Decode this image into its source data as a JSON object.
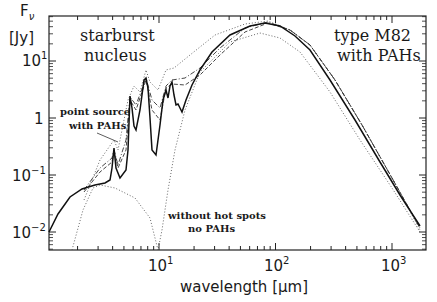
{
  "chart_data": {
    "type": "line",
    "title": "",
    "xlabel": "wavelength [μm]",
    "ylabel": "Fν [Jy]",
    "xscale": "log",
    "yscale": "log",
    "xlim": [
      1.1,
      2000
    ],
    "ylim": [
      0.004,
      60
    ],
    "grid": false,
    "x_ticks": [
      "10^1",
      "10^2",
      "10^3"
    ],
    "y_ticks": [
      "10^-2",
      "10^-1",
      "1",
      "10^1"
    ],
    "annotations": [
      {
        "text": "starburst nucleus",
        "position": "top-left"
      },
      {
        "text": "type M82 with PAHs",
        "position": "top-right"
      },
      {
        "text": "point source with PAHs",
        "position": "left, y≈1"
      },
      {
        "text": "without hot spots no PAHs",
        "position": "bottom-center"
      }
    ],
    "series": [
      {
        "name": "type M82 with PAHs (solid)",
        "style": "solid",
        "x": [
          1.1,
          1.5,
          2.0,
          2.7,
          3.1,
          3.3,
          3.5,
          4.5,
          5.5,
          6.2,
          6.7,
          7.7,
          8.6,
          9.7,
          11.3,
          12.7,
          14,
          20,
          35,
          60,
          80,
          100,
          200,
          500,
          1000,
          1800
        ],
        "y": [
          0.01,
          0.025,
          0.045,
          0.055,
          0.07,
          0.25,
          0.06,
          0.1,
          0.15,
          2.0,
          0.6,
          4.0,
          0.8,
          0.15,
          2.5,
          3.2,
          1.2,
          3.5,
          12,
          30,
          35,
          34,
          12,
          1.0,
          0.12,
          0.015
        ]
      },
      {
        "name": "dash-dot model",
        "style": "dashdot",
        "x": [
          2,
          3,
          4,
          6,
          8,
          12,
          20,
          40,
          80,
          200,
          1000
        ],
        "y": [
          0.05,
          0.15,
          0.25,
          1.2,
          2,
          2.8,
          5,
          15,
          32,
          12,
          0.11
        ]
      },
      {
        "name": "dashed model",
        "style": "dashed",
        "x": [
          2,
          3,
          4,
          6,
          8,
          12,
          20,
          40,
          80,
          200,
          1000
        ],
        "y": [
          0.05,
          0.12,
          0.2,
          1.0,
          1.8,
          2.5,
          4,
          13,
          30,
          12,
          0.11
        ]
      },
      {
        "name": "point source with PAHs (dotted upper)",
        "style": "dotted",
        "x": [
          2,
          3,
          4,
          6,
          7.7,
          10,
          15,
          30,
          60,
          100,
          200,
          1000
        ],
        "y": [
          0.04,
          0.2,
          0.5,
          2.5,
          5,
          4,
          6,
          18,
          35,
          33,
          12,
          0.11
        ]
      },
      {
        "name": "without hot spots no PAHs (dotted lower)",
        "style": "dotted",
        "x": [
          1.5,
          2.0,
          2.7,
          4,
          6,
          8.5,
          9.7,
          11,
          15,
          25,
          50,
          100,
          200,
          1000,
          1800
        ],
        "y": [
          0.004,
          0.02,
          0.05,
          0.035,
          0.02,
          0.008,
          0.004,
          0.02,
          0.3,
          3,
          15,
          22,
          9,
          0.09,
          0.012
        ]
      }
    ]
  },
  "labels": {
    "y_label_top": "F",
    "y_label_sub": "ν",
    "y_label_unit": "[Jy]",
    "x_label": "wavelength [μm]",
    "ann_starburst_1": "starburst",
    "ann_starburst_2": "nucleus",
    "ann_m82_1": "type M82",
    "ann_m82_2": "with PAHs",
    "ann_point_1": "point source",
    "ann_point_2": "with PAHs",
    "ann_nohot_1": "without hot spots",
    "ann_nohot_2": "no PAHs",
    "ytick_1": "1",
    "xtick_base": "10",
    "ytick_base": "10"
  }
}
